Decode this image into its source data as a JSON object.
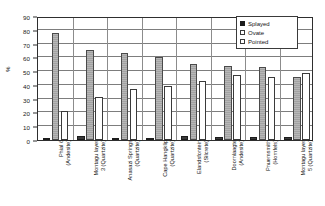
{
  "chart_data": {
    "type": "bar",
    "title": "",
    "xlabel": "",
    "ylabel": "%",
    "ylim": [
      0,
      90
    ],
    "ytick_values": [
      0,
      10,
      20,
      30,
      40,
      50,
      60,
      70,
      80,
      90
    ],
    "ytick_labels": [
      "0",
      "10",
      "20",
      "30",
      "40",
      "50",
      "60",
      "70",
      "80",
      "90"
    ],
    "grid": true,
    "legend_position": "top-right",
    "categories": [
      "Phial 6 (Andesite)",
      "Montagu layer 3 (Quartzite)",
      "Anasazi Springs (Quartzite)",
      "Cape Hangklip (Quartzite)",
      "Elandsfontein (Silcrete)",
      "Doornlaagte (Andesite)",
      "Pnuemsmith (Hornfels)",
      "Montagu layer 5 (Quartzite)"
    ],
    "category_lines": [
      [
        "Phial 6",
        "(Andesite)"
      ],
      [
        "Montagu layer",
        "3 (Quartzite)"
      ],
      [
        "Anasazi Springs",
        "(Quartzite)"
      ],
      [
        "Cape Hangklip",
        "(Quartzite)"
      ],
      [
        "Elandsfontein",
        "(Silcrete)"
      ],
      [
        "Doornlaagte",
        "(Andesite)"
      ],
      [
        "Pnuemsmith",
        "(Hornfels)"
      ],
      [
        "Montagu layer",
        "5 (Quartzite)"
      ]
    ],
    "series": [
      {
        "name": "Splayed",
        "color": "#2b2b2b",
        "values": [
          1,
          3,
          1,
          1,
          3,
          2,
          2,
          2
        ]
      },
      {
        "name": "Ovate",
        "color": "#ababab",
        "values": [
          78,
          65,
          63,
          60,
          55,
          54,
          53,
          46
        ]
      },
      {
        "name": "Pointed",
        "color": "#ffffff",
        "values": [
          21,
          31,
          37,
          39,
          43,
          47,
          46,
          49
        ]
      }
    ]
  },
  "legend": {
    "items": [
      {
        "label": "Splayed",
        "swatch": "splayed-swatch-icon"
      },
      {
        "label": "Ovate",
        "swatch": "ovate-swatch-icon"
      },
      {
        "label": "Pointed",
        "swatch": "pointed-swatch-icon"
      }
    ]
  }
}
